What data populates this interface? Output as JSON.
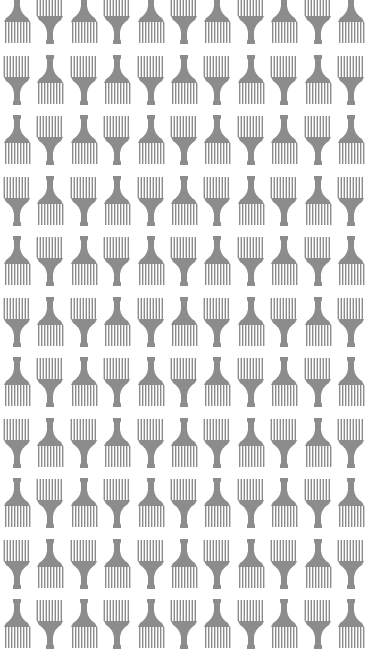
{
  "pattern": {
    "motif": "afro-pick-comb-icon",
    "layout": "checkerboard-alternating-orientation",
    "columns": 11,
    "rows": 11,
    "colors": {
      "background": "#ffffff",
      "comb": "#8c8c8c"
    }
  }
}
